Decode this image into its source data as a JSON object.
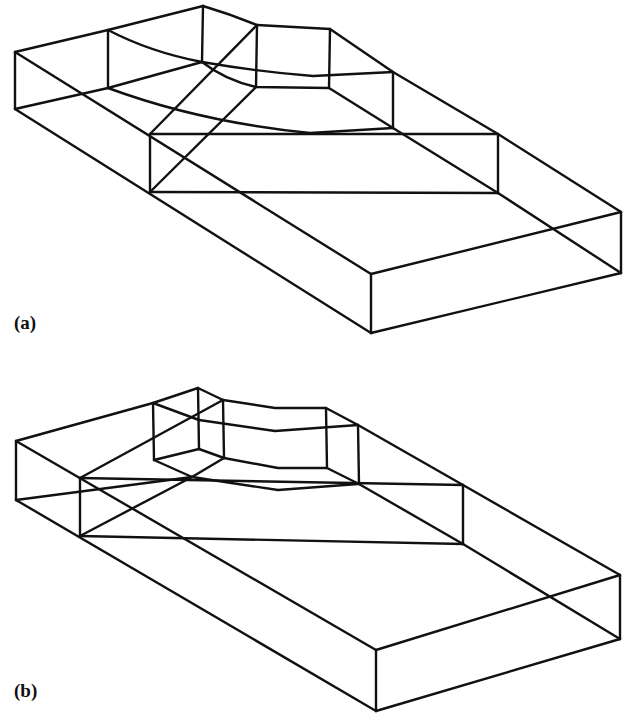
{
  "figure": {
    "panels": [
      {
        "label": "(a)",
        "description": "Wireframe isometric block with a curved recessed upper step (variant a)",
        "stroke_color": "#111111",
        "background": "#ffffff"
      },
      {
        "label": "(b)",
        "description": "Wireframe isometric block with a smaller curved recessed upper step (variant b)",
        "stroke_color": "#111111",
        "background": "#ffffff"
      }
    ]
  }
}
